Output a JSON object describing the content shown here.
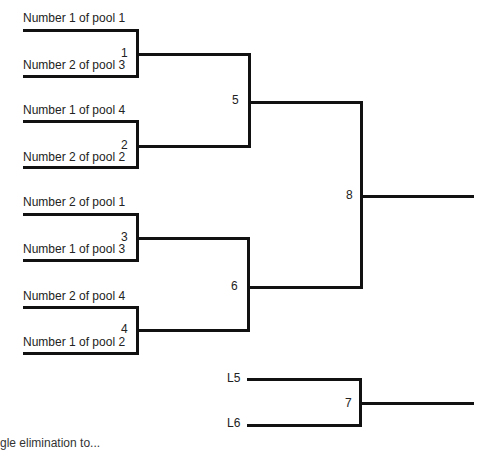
{
  "bracket": {
    "round1": [
      {
        "match": "1",
        "top": "Number 1 of pool 1",
        "bottom": "Number 2 of pool 3"
      },
      {
        "match": "2",
        "top": "Number 1 of pool 4",
        "bottom": "Number 2 of pool 2"
      },
      {
        "match": "3",
        "top": "Number 2 of pool 1",
        "bottom": "Number 1 of pool 3"
      },
      {
        "match": "4",
        "top": "Number 2 of pool 4",
        "bottom": "Number 1 of pool 2"
      }
    ],
    "semis": [
      {
        "match": "5"
      },
      {
        "match": "6"
      }
    ],
    "final": {
      "match": "8"
    },
    "third_place": {
      "match": "7",
      "top": "L5",
      "bottom": "L6"
    }
  },
  "caption": "gle elimination to..."
}
